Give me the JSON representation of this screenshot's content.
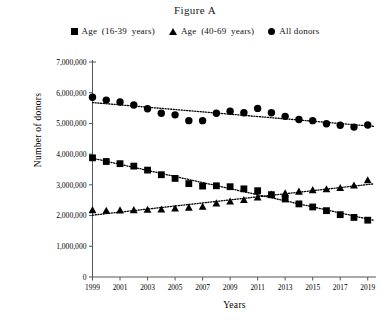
{
  "figure": {
    "title": "Figure A",
    "axis_label_x": "Years",
    "axis_label_y": "Number of donors"
  },
  "legend": {
    "position": "top-center",
    "items": [
      {
        "marker": "square-marker-icon",
        "label": "Age (16-39 years)"
      },
      {
        "marker": "triangle-marker-icon",
        "label": "Age (40-69 years)"
      },
      {
        "marker": "circle-marker-icon",
        "label": "All donors"
      }
    ]
  },
  "chart_data": {
    "type": "scatter",
    "title": "Figure A",
    "xlabel": "Years",
    "ylabel": "Number of donors",
    "xlim": [
      1999,
      2019.6
    ],
    "ylim": [
      0,
      7000000
    ],
    "grid": false,
    "legend_position": "top-center",
    "x": [
      1999,
      2000,
      2001,
      2002,
      2003,
      2004,
      2005,
      2006,
      2007,
      2008,
      2009,
      2010,
      2011,
      2012,
      2013,
      2014,
      2015,
      2016,
      2017,
      2018,
      2019
    ],
    "xticks": [
      1999,
      2001,
      2003,
      2005,
      2007,
      2009,
      2011,
      2013,
      2015,
      2017,
      2019
    ],
    "xtick_labels": [
      "1999",
      "2001",
      "2003",
      "2005",
      "2007",
      "2009",
      "2011",
      "2013",
      "2015",
      "2017",
      "2019"
    ],
    "yticks": [
      0,
      1000000,
      2000000,
      3000000,
      4000000,
      5000000,
      6000000,
      7000000
    ],
    "ytick_labels": [
      "0",
      "1,000,000",
      "2,000,000",
      "3,000,000",
      "4,000,000",
      "5,000,000",
      "6,000,000",
      "7,000,000"
    ],
    "series": [
      {
        "name": "All donors",
        "marker": "circle",
        "color": "#000000",
        "trendline": true,
        "trendline_style": "dotted",
        "values": [
          5850000,
          5760000,
          5700000,
          5600000,
          5480000,
          5330000,
          5280000,
          5090000,
          5090000,
          5330000,
          5400000,
          5350000,
          5490000,
          5350000,
          5230000,
          5130000,
          5090000,
          4990000,
          4940000,
          4880000,
          4950000
        ]
      },
      {
        "name": "Age (16-39 years)",
        "marker": "square",
        "color": "#000000",
        "trendline": true,
        "trendline_style": "dotted",
        "values": [
          3880000,
          3760000,
          3690000,
          3610000,
          3480000,
          3330000,
          3210000,
          3040000,
          2960000,
          2970000,
          2940000,
          2870000,
          2810000,
          2680000,
          2540000,
          2380000,
          2280000,
          2160000,
          2030000,
          1940000,
          1850000
        ]
      },
      {
        "name": "Age (40-69 years)",
        "marker": "triangle",
        "color": "#000000",
        "trendline": true,
        "trendline_style": "dotted",
        "values": [
          2180000,
          2160000,
          2170000,
          2180000,
          2190000,
          2200000,
          2230000,
          2260000,
          2290000,
          2400000,
          2460000,
          2510000,
          2590000,
          2690000,
          2730000,
          2780000,
          2830000,
          2860000,
          2900000,
          2980000,
          3150000
        ]
      }
    ]
  }
}
